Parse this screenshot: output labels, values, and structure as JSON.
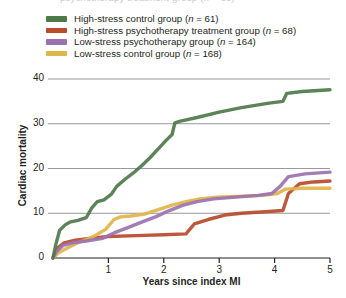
{
  "clipped_header_text": "psychotherapy treatment group (n = 68)",
  "legend": {
    "position": "top-left",
    "items": [
      {
        "label": "High-stress control group (n = 61)",
        "text_before": "High-stress control group (",
        "italic": "n",
        "text_after": " = 61)",
        "color": "#4e7a4a",
        "name": "high-stress-control"
      },
      {
        "label": "High-stress psychotherapy treatment group (n = 68)",
        "text_before": "High-stress psychotherapy treatment group (",
        "italic": "n",
        "text_after": " = 68)",
        "color": "#b94a2c",
        "name": "high-stress-psychotherapy"
      },
      {
        "label": "Low-stress psychotherapy group (n = 164)",
        "text_before": "Low-stress psychotherapy group (",
        "italic": "n",
        "text_after": " = 164)",
        "color": "#9b72b0",
        "name": "low-stress-psychotherapy"
      },
      {
        "label": "Low-stress control group (n = 168)",
        "text_before": "Low-stress control group (",
        "italic": "n",
        "text_after": " = 168)",
        "color": "#e0b54a",
        "name": "low-stress-control"
      }
    ]
  },
  "axes": {
    "y_label": "Cardiac mortality",
    "x_label": "Years since index MI",
    "y_ticks": [
      "0",
      "10",
      "20",
      "30",
      "40"
    ],
    "x_ticks": [
      "1",
      "2",
      "3",
      "4",
      "5"
    ]
  },
  "chart_data": {
    "type": "line",
    "title": "",
    "xlabel": "Years since index MI",
    "ylabel": "Cardiac mortality",
    "xlim": [
      0,
      5
    ],
    "ylim": [
      0,
      42
    ],
    "grid": "horizontal",
    "legend_position": "top-left",
    "series": [
      {
        "name": "High-stress control group (n = 61)",
        "color": "#4e7a4a",
        "points": [
          [
            0.0,
            0.0
          ],
          [
            0.05,
            3.0
          ],
          [
            0.12,
            6.2
          ],
          [
            0.22,
            7.4
          ],
          [
            0.3,
            8.0
          ],
          [
            0.45,
            8.4
          ],
          [
            0.6,
            9.0
          ],
          [
            0.7,
            11.2
          ],
          [
            0.8,
            12.6
          ],
          [
            0.92,
            13.0
          ],
          [
            1.05,
            14.2
          ],
          [
            1.15,
            16.0
          ],
          [
            1.3,
            17.6
          ],
          [
            1.45,
            19.0
          ],
          [
            1.6,
            20.6
          ],
          [
            1.75,
            22.4
          ],
          [
            1.9,
            24.4
          ],
          [
            2.05,
            26.4
          ],
          [
            2.15,
            27.6
          ],
          [
            2.2,
            30.2
          ],
          [
            2.3,
            30.6
          ],
          [
            2.6,
            31.4
          ],
          [
            3.0,
            32.6
          ],
          [
            3.4,
            33.6
          ],
          [
            3.9,
            34.6
          ],
          [
            4.15,
            35.0
          ],
          [
            4.22,
            36.8
          ],
          [
            4.5,
            37.2
          ],
          [
            5.0,
            37.6
          ]
        ]
      },
      {
        "name": "High-stress psychotherapy treatment group (n = 68)",
        "color": "#b94a2c",
        "points": [
          [
            0.0,
            0.0
          ],
          [
            0.08,
            2.2
          ],
          [
            0.2,
            3.4
          ],
          [
            0.4,
            4.0
          ],
          [
            0.7,
            4.4
          ],
          [
            1.0,
            4.8
          ],
          [
            1.5,
            5.0
          ],
          [
            2.0,
            5.2
          ],
          [
            2.4,
            5.4
          ],
          [
            2.55,
            7.6
          ],
          [
            2.8,
            8.6
          ],
          [
            3.1,
            9.6
          ],
          [
            3.4,
            10.0
          ],
          [
            3.9,
            10.4
          ],
          [
            4.15,
            10.6
          ],
          [
            4.25,
            14.4
          ],
          [
            4.45,
            16.6
          ],
          [
            4.7,
            17.0
          ],
          [
            5.0,
            17.2
          ]
        ]
      },
      {
        "name": "Low-stress psychotherapy group (n = 164)",
        "color": "#9b72b0",
        "points": [
          [
            0.0,
            0.0
          ],
          [
            0.06,
            1.4
          ],
          [
            0.18,
            2.8
          ],
          [
            0.35,
            3.4
          ],
          [
            0.6,
            3.8
          ],
          [
            0.9,
            4.4
          ],
          [
            1.1,
            5.6
          ],
          [
            1.35,
            6.8
          ],
          [
            1.6,
            8.0
          ],
          [
            1.85,
            9.2
          ],
          [
            2.1,
            10.6
          ],
          [
            2.35,
            11.8
          ],
          [
            2.6,
            12.6
          ],
          [
            2.9,
            13.2
          ],
          [
            3.3,
            13.6
          ],
          [
            3.7,
            14.0
          ],
          [
            3.95,
            14.4
          ],
          [
            4.1,
            16.0
          ],
          [
            4.25,
            18.2
          ],
          [
            4.55,
            18.8
          ],
          [
            5.0,
            19.2
          ]
        ]
      },
      {
        "name": "Low-stress control group (n = 168)",
        "color": "#e0b54a",
        "points": [
          [
            0.0,
            0.0
          ],
          [
            0.1,
            1.2
          ],
          [
            0.25,
            2.2
          ],
          [
            0.45,
            3.4
          ],
          [
            0.7,
            4.6
          ],
          [
            0.95,
            6.4
          ],
          [
            1.1,
            8.6
          ],
          [
            1.22,
            9.2
          ],
          [
            1.4,
            9.4
          ],
          [
            1.65,
            9.8
          ],
          [
            1.9,
            10.8
          ],
          [
            2.15,
            11.8
          ],
          [
            2.4,
            12.6
          ],
          [
            2.65,
            13.2
          ],
          [
            2.95,
            13.6
          ],
          [
            3.4,
            13.8
          ],
          [
            3.8,
            14.0
          ],
          [
            4.05,
            14.4
          ],
          [
            4.2,
            15.4
          ],
          [
            4.5,
            15.6
          ],
          [
            5.0,
            15.6
          ]
        ]
      }
    ]
  }
}
